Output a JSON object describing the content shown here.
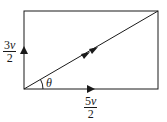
{
  "diagram": {
    "type": "vector-resolution",
    "rectangle": {
      "x": 24,
      "y": 11,
      "width": 134,
      "height": 78
    },
    "stroke_color": "#1a1a1a",
    "vertical_component": {
      "coefficient": "3",
      "variable": "v",
      "denominator": "2",
      "direction": "up"
    },
    "horizontal_component": {
      "coefficient": "5",
      "variable": "v",
      "denominator": "2",
      "direction": "right"
    },
    "resultant": {
      "from": "bottom-left",
      "to": "top-right",
      "arrow": "double"
    },
    "angle_label": "θ"
  }
}
